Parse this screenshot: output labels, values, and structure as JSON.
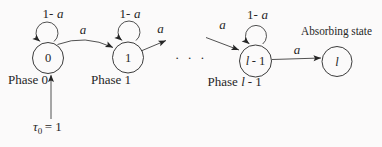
{
  "figure": {
    "colors": {
      "ink": "#262626",
      "paper": "#fbfafa"
    },
    "prob_label": "a",
    "loop_label_prefix": "1-",
    "states": [
      {
        "name": "0",
        "phase": "Phase 0"
      },
      {
        "name": "1",
        "phase": "Phase 1"
      }
    ],
    "state_l1": {
      "name_l": "l",
      "name_rest": "- 1",
      "phase_prefix": "Phase",
      "phase_l": "l",
      "phase_rest": "- 1"
    },
    "absorbing": {
      "name": "l",
      "caption": "Absorbing state"
    },
    "ellipsis": "· · ·",
    "initial": {
      "tau": "τ",
      "subscript": "0",
      "equals": "= 1"
    }
  }
}
